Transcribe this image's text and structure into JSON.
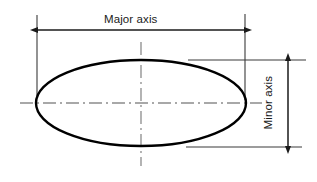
{
  "figure": {
    "type": "engineering-dimension-drawing",
    "background_color": "#ffffff",
    "outline_color": "#000000",
    "dimension_line_color": "#1a1a1a",
    "centerline_color": "#8c8c8c",
    "labels": {
      "major_axis": "Major axis",
      "minor_axis": "Minor axis"
    },
    "geometry": {
      "ellipse_center_x": 141,
      "ellipse_center_y": 103,
      "ellipse_radius_x": 105,
      "ellipse_radius_y": 43,
      "ellipse_stroke_width": 2.4
    },
    "dimensions": {
      "major": {
        "orientation": "horizontal",
        "line_y": 30,
        "start_x": 37,
        "end_x": 245,
        "arrowheads": "both"
      },
      "minor": {
        "orientation": "vertical",
        "line_x": 288,
        "start_y": 60,
        "end_y": 147,
        "arrowheads": "both"
      }
    },
    "extension_lines": [
      {
        "name": "left-major-extension",
        "x1": 37,
        "y1": 15,
        "x2": 37,
        "y2": 96
      },
      {
        "name": "right-major-extension",
        "x1": 245,
        "y1": 14,
        "x2": 245,
        "y2": 100
      },
      {
        "name": "top-minor-extension",
        "x1": 188,
        "y1": 60,
        "x2": 306,
        "y2": 60
      },
      {
        "name": "bottom-minor-extension",
        "x1": 186,
        "y1": 147,
        "x2": 302,
        "y2": 147
      }
    ],
    "centerlines": [
      {
        "name": "horizontal-centerline",
        "x1": 20,
        "y1": 103,
        "x2": 262,
        "y2": 103
      },
      {
        "name": "vertical-centerline",
        "x1": 141,
        "y1": 42,
        "x2": 141,
        "y2": 166
      }
    ]
  }
}
